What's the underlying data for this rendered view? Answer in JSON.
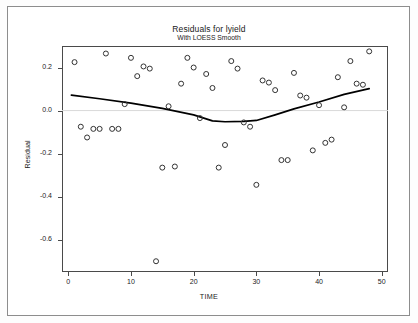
{
  "page": {
    "background": "#ffffff",
    "border_color": "#8d8d8d"
  },
  "chart_data": {
    "type": "scatter",
    "title": "Residuals for lyield",
    "subtitle": "With LOESS Smooth",
    "xlabel": "TIME",
    "ylabel": "Residual",
    "xlim": [
      -1,
      51
    ],
    "ylim": [
      -0.75,
      0.3
    ],
    "xticks": [
      0,
      10,
      20,
      30,
      40,
      50
    ],
    "yticks": [
      0.2,
      0.0,
      -0.2,
      -0.4,
      -0.6
    ],
    "xtick_labels": [
      "0",
      "10",
      "20",
      "30",
      "40",
      "50"
    ],
    "ytick_labels": [
      "0.2",
      "0.0",
      "-0.2",
      "-0.4",
      "-0.6"
    ],
    "grid": false,
    "zero_reference_line": true,
    "zero_line_color": "#d9d9d9",
    "marker": "open-circle",
    "marker_color": "#333333",
    "series": [
      {
        "name": "Residual",
        "type": "scatter",
        "points": [
          [
            1,
            0.225
          ],
          [
            2,
            -0.075
          ],
          [
            3,
            -0.125
          ],
          [
            4,
            -0.085
          ],
          [
            5,
            -0.085
          ],
          [
            6,
            0.265
          ],
          [
            7,
            -0.085
          ],
          [
            8,
            -0.085
          ],
          [
            9,
            0.03
          ],
          [
            10,
            0.245
          ],
          [
            11,
            0.16
          ],
          [
            12,
            0.205
          ],
          [
            13,
            0.195
          ],
          [
            14,
            -0.7
          ],
          [
            15,
            -0.265
          ],
          [
            16,
            0.02
          ],
          [
            17,
            -0.26
          ],
          [
            18,
            0.125
          ],
          [
            19,
            0.245
          ],
          [
            20,
            0.2
          ],
          [
            21,
            -0.035
          ],
          [
            22,
            0.17
          ],
          [
            23,
            0.105
          ],
          [
            24,
            -0.265
          ],
          [
            25,
            -0.16
          ],
          [
            26,
            0.23
          ],
          [
            27,
            0.195
          ],
          [
            28,
            -0.055
          ],
          [
            29,
            -0.075
          ],
          [
            30,
            -0.345
          ],
          [
            31,
            0.14
          ],
          [
            32,
            0.13
          ],
          [
            33,
            0.095
          ],
          [
            34,
            -0.23
          ],
          [
            35,
            -0.23
          ],
          [
            36,
            0.175
          ],
          [
            37,
            0.07
          ],
          [
            38,
            0.06
          ],
          [
            39,
            -0.185
          ],
          [
            40,
            0.025
          ],
          [
            41,
            -0.15
          ],
          [
            42,
            -0.135
          ],
          [
            43,
            0.155
          ],
          [
            44,
            0.015
          ],
          [
            45,
            0.23
          ],
          [
            46,
            0.125
          ],
          [
            47,
            0.12
          ],
          [
            48,
            0.275
          ]
        ]
      },
      {
        "name": "LOESS Smooth",
        "type": "line",
        "color": "#000000",
        "points": [
          [
            0.5,
            0.072
          ],
          [
            5,
            0.055
          ],
          [
            10,
            0.035
          ],
          [
            15,
            0.01
          ],
          [
            20,
            -0.02
          ],
          [
            23,
            -0.048
          ],
          [
            25,
            -0.052
          ],
          [
            28,
            -0.05
          ],
          [
            30,
            -0.046
          ],
          [
            33,
            -0.02
          ],
          [
            36,
            0.008
          ],
          [
            40,
            0.04
          ],
          [
            44,
            0.075
          ],
          [
            48,
            0.102
          ]
        ]
      }
    ]
  }
}
